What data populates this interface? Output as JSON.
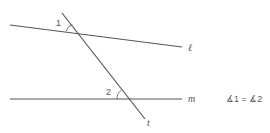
{
  "diagram": {
    "colors": {
      "line": "#555555",
      "text": "#555555",
      "background": "#ffffff"
    },
    "lines": [
      {
        "name": "l",
        "label": "ℓ",
        "x1": 10,
        "y1": 25,
        "x2": 182,
        "y2": 47
      },
      {
        "name": "m",
        "label": "m",
        "x1": 10,
        "y1": 99,
        "x2": 182,
        "y2": 99
      },
      {
        "name": "t",
        "label": "t",
        "x1": 62,
        "y1": 13,
        "x2": 145,
        "y2": 119
      }
    ],
    "angles": [
      {
        "label": "1"
      },
      {
        "label": "2"
      }
    ],
    "statement": "∡1 = ∡2"
  }
}
